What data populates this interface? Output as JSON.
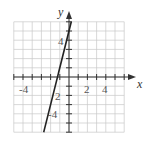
{
  "chart_data": {
    "type": "line",
    "title": "",
    "xlabel": "x",
    "ylabel": "y",
    "xlim": [
      -6,
      6
    ],
    "ylim": [
      -6,
      6
    ],
    "grid": true,
    "x_ticks": [
      "-4",
      "2",
      "4"
    ],
    "y_ticks": [
      "4",
      "2",
      "-4"
    ],
    "series": [
      {
        "name": "line",
        "equation": "y = 4x + 5",
        "x": [
          -2.75,
          0.25
        ],
        "y": [
          -6,
          6
        ]
      }
    ],
    "colors": {
      "grid": "#c8c8c8",
      "axis": "#333333",
      "line": "#222222"
    }
  }
}
